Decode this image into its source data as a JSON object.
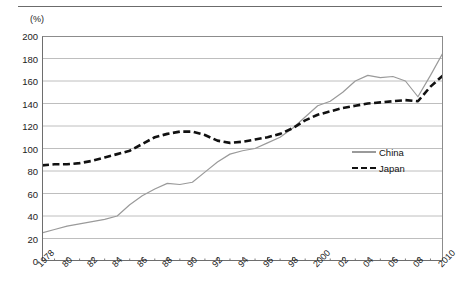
{
  "chart_data": {
    "type": "line",
    "title": "",
    "subtitle": "",
    "xlabel": "",
    "ylabel": "",
    "unit_label": "(%)",
    "ylim": [
      0,
      200
    ],
    "ytick_step": 20,
    "yticks": [
      0,
      20,
      40,
      60,
      80,
      100,
      120,
      140,
      160,
      180,
      200
    ],
    "ytick_labels": [
      "0",
      "20",
      "40",
      "60",
      "80",
      "100",
      "120",
      "140",
      "160",
      "180",
      "200"
    ],
    "xlim": [
      1978,
      2010
    ],
    "x": [
      1978,
      1979,
      1980,
      1981,
      1982,
      1983,
      1984,
      1985,
      1986,
      1987,
      1988,
      1989,
      1990,
      1991,
      1992,
      1993,
      1994,
      1995,
      1996,
      1997,
      1998,
      1999,
      2000,
      2001,
      2002,
      2003,
      2004,
      2005,
      2006,
      2007,
      2008,
      2009,
      2010
    ],
    "xtick_labels": [
      "1978",
      "80",
      "82",
      "84",
      "86",
      "88",
      "90",
      "92",
      "94",
      "96",
      "98",
      "2000",
      "02",
      "04",
      "06",
      "08",
      "2010"
    ],
    "xtick_values": [
      1978,
      1980,
      1982,
      1984,
      1986,
      1988,
      1990,
      1992,
      1994,
      1996,
      1998,
      2000,
      2002,
      2004,
      2006,
      2008,
      2010
    ],
    "grid": "horizontal",
    "legend_position": "right-middle",
    "series": [
      {
        "name": "China",
        "color": "#9a9a9a",
        "style": "solid",
        "values": [
          25,
          28,
          31,
          33,
          35,
          37,
          40,
          50,
          58,
          64,
          69,
          68,
          70,
          79,
          88,
          95,
          98,
          100,
          105,
          110,
          118,
          128,
          138,
          142,
          150,
          160,
          165,
          163,
          164,
          160,
          146,
          165,
          185
        ]
      },
      {
        "name": "Japan",
        "color": "#111111",
        "style": "dashed",
        "values": [
          85,
          86,
          86,
          87,
          89,
          92,
          95,
          98,
          104,
          110,
          113,
          115,
          115,
          112,
          107,
          105,
          106,
          108,
          110,
          113,
          118,
          125,
          130,
          133,
          136,
          138,
          140,
          141,
          142,
          143,
          142,
          155,
          165
        ]
      }
    ],
    "legend": [
      {
        "label": "China",
        "key": "solid-line-gray"
      },
      {
        "label": "Japan",
        "key": "dashed-line-black"
      }
    ]
  },
  "axes": {
    "unit_label": "(%)"
  }
}
